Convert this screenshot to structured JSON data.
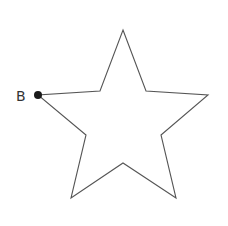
{
  "diagram": {
    "shape": "five-pointed star",
    "stroke_color": "#555555",
    "fill_color": "#ffffff",
    "point_color": "#1a1a1a",
    "vertices": [
      [
        123,
        30
      ],
      [
        146,
        91
      ],
      [
        208,
        95
      ],
      [
        161,
        135
      ],
      [
        176,
        198
      ],
      [
        123,
        163
      ],
      [
        71,
        198
      ],
      [
        86,
        135
      ],
      [
        38,
        95
      ],
      [
        100,
        91
      ]
    ],
    "marked_point": {
      "label": "B",
      "x": 38,
      "y": 95
    }
  }
}
